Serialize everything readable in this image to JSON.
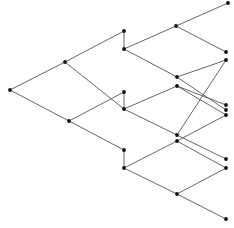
{
  "diagram": {
    "type": "binary-tree-lattice",
    "background": "#ffffff",
    "edge_color": "#555555",
    "node_color": "#111111",
    "node_radius": 1.9,
    "nodes": [
      {
        "id": "n0",
        "x": 10,
        "y": 90
      },
      {
        "id": "n1",
        "x": 65,
        "y": 62
      },
      {
        "id": "n2",
        "x": 69,
        "y": 121
      },
      {
        "id": "n3",
        "x": 124,
        "y": 31
      },
      {
        "id": "n4",
        "x": 124,
        "y": 49
      },
      {
        "id": "n5",
        "x": 124,
        "y": 92
      },
      {
        "id": "n6",
        "x": 124,
        "y": 109
      },
      {
        "id": "n7",
        "x": 124,
        "y": 150
      },
      {
        "id": "n8",
        "x": 124,
        "y": 168
      },
      {
        "id": "n9",
        "x": 176,
        "y": 26
      },
      {
        "id": "n10",
        "x": 177,
        "y": 77
      },
      {
        "id": "n11",
        "x": 177,
        "y": 86
      },
      {
        "id": "n12",
        "x": 177,
        "y": 135
      },
      {
        "id": "n13",
        "x": 177,
        "y": 141
      },
      {
        "id": "n14",
        "x": 177,
        "y": 194
      },
      {
        "id": "n15",
        "x": 228,
        "y": 3
      },
      {
        "id": "n16",
        "x": 226,
        "y": 52
      },
      {
        "id": "n17",
        "x": 226,
        "y": 60
      },
      {
        "id": "n18",
        "x": 226,
        "y": 105
      },
      {
        "id": "n19",
        "x": 226,
        "y": 110
      },
      {
        "id": "n20",
        "x": 226,
        "y": 115
      },
      {
        "id": "n21",
        "x": 226,
        "y": 159
      },
      {
        "id": "n22",
        "x": 226,
        "y": 168
      },
      {
        "id": "n23",
        "x": 226,
        "y": 219
      }
    ],
    "edges": [
      [
        "n0",
        "n1"
      ],
      [
        "n0",
        "n2"
      ],
      [
        "n1",
        "n3"
      ],
      [
        "n1",
        "n6"
      ],
      [
        "n2",
        "n5"
      ],
      [
        "n2",
        "n7"
      ],
      [
        "n3",
        "n4"
      ],
      [
        "n5",
        "n6"
      ],
      [
        "n7",
        "n8"
      ],
      [
        "n4",
        "n9"
      ],
      [
        "n4",
        "n10"
      ],
      [
        "n6",
        "n11"
      ],
      [
        "n6",
        "n12"
      ],
      [
        "n8",
        "n13"
      ],
      [
        "n8",
        "n14"
      ],
      [
        "n9",
        "n15"
      ],
      [
        "n9",
        "n16"
      ],
      [
        "n10",
        "n17"
      ],
      [
        "n10",
        "n19"
      ],
      [
        "n11",
        "n18"
      ],
      [
        "n11",
        "n20"
      ],
      [
        "n12",
        "n17"
      ],
      [
        "n12",
        "n21"
      ],
      [
        "n13",
        "n20"
      ],
      [
        "n13",
        "n22"
      ],
      [
        "n14",
        "n22"
      ],
      [
        "n14",
        "n23"
      ]
    ]
  }
}
